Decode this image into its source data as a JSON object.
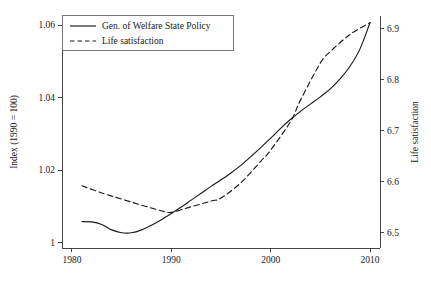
{
  "chart_data": {
    "type": "line",
    "title": "",
    "subtitle": "",
    "xlabel": "",
    "ylabel": "Index (1990 = 100)",
    "y2label": "Life satisfaction",
    "grid": false,
    "legend_position": "top-left",
    "xlim": [
      1979.0,
      2011.0
    ],
    "ylim": [
      0.9985,
      1.0625
    ],
    "y2lim": [
      6.47,
      6.925
    ],
    "xticks": [
      1980,
      1990,
      2000,
      2010
    ],
    "xtick_labels": [
      "1980",
      "1990",
      "2000",
      "2010"
    ],
    "yticks": [
      1,
      1.02,
      1.04,
      1.06
    ],
    "ytick_labels": [
      "1",
      "1.02",
      "1.04",
      "1.06"
    ],
    "y2ticks": [
      6.5,
      6.6,
      6.7,
      6.8,
      6.9
    ],
    "y2tick_labels": [
      "6.5",
      "6.6",
      "6.7",
      "6.8",
      "6.9"
    ],
    "series": [
      {
        "name": "Gen. of Welfare State Policy",
        "axis": "left",
        "style": "solid",
        "color": "#1a1a1a",
        "x": [
          1981,
          1982,
          1983,
          1984,
          1985,
          1986,
          1987,
          1988,
          1989,
          1990,
          1991,
          1992,
          1993,
          1994,
          1995,
          1996,
          1997,
          1998,
          1999,
          2000,
          2001,
          2002,
          2003,
          2004,
          2005,
          2006,
          2007,
          2008,
          2009,
          2010
        ],
        "y": [
          1.0058,
          1.0057,
          1.005,
          1.0035,
          1.0027,
          1.0027,
          1.0035,
          1.0048,
          1.0063,
          1.008,
          1.0098,
          1.0117,
          1.0136,
          1.0155,
          1.0173,
          1.0192,
          1.0213,
          1.0237,
          1.0262,
          1.0288,
          1.0315,
          1.034,
          1.0362,
          1.0382,
          1.0402,
          1.0424,
          1.0452,
          1.0487,
          1.0535,
          1.0607
        ]
      },
      {
        "name": "Life satisfaction",
        "axis": "right",
        "style": "dashed",
        "color": "#1a1a1a",
        "x": [
          1981,
          1983,
          1985,
          1987,
          1989,
          1990,
          1992,
          1994,
          1995,
          1997,
          1999,
          2000,
          2002,
          2003,
          2005,
          2006,
          2008,
          2010
        ],
        "y": [
          6.592,
          6.578,
          6.566,
          6.554,
          6.543,
          6.54,
          6.551,
          6.562,
          6.568,
          6.598,
          6.64,
          6.662,
          6.718,
          6.76,
          6.833,
          6.855,
          6.889,
          6.912
        ]
      }
    ],
    "legend": [
      {
        "label": "Gen. of Welfare State Policy",
        "style": "solid"
      },
      {
        "label": "Life satisfaction",
        "style": "dashed"
      }
    ]
  }
}
